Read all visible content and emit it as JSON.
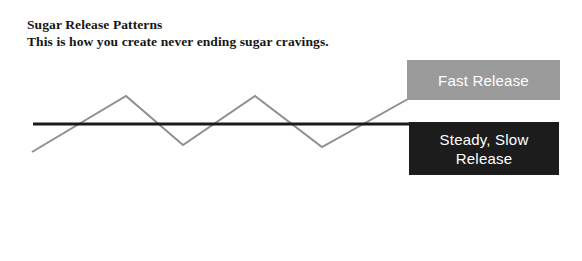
{
  "page": {
    "background": "#ffffff",
    "width": 582,
    "height": 261
  },
  "heading": {
    "title": "Sugar Release Patterns",
    "subtitle": "This is how you create never ending sugar cravings."
  },
  "callouts": {
    "fast": {
      "label": "Fast Release",
      "background": "#9b9b9b",
      "text_color": "#ffffff"
    },
    "steady": {
      "label": "Steady, Slow\nRelease",
      "background": "#1c1c1c",
      "text_color": "#ffffff"
    }
  },
  "chart_data": {
    "type": "line",
    "title": "Sugar Release Patterns",
    "subtitle": "This is how you create never ending sugar cravings.",
    "xlabel": "",
    "ylabel": "",
    "grid": false,
    "legend_position": "right-inline-callouts",
    "axis_ranges": {
      "x": [
        0,
        582
      ],
      "y": [
        0,
        261
      ]
    },
    "series": [
      {
        "name": "Fast Release",
        "style": "zigzag",
        "color": "#8f8f8f",
        "stroke_width": 2,
        "points": [
          [
            32,
            152
          ],
          [
            126,
            96
          ],
          [
            183,
            145
          ],
          [
            255,
            96
          ],
          [
            322,
            147
          ],
          [
            408,
            99
          ]
        ]
      },
      {
        "name": "Steady, Slow Release",
        "style": "flat",
        "color": "#1a1a1a",
        "stroke_width": 3,
        "points": [
          [
            33,
            124
          ],
          [
            410,
            124
          ]
        ]
      }
    ]
  }
}
